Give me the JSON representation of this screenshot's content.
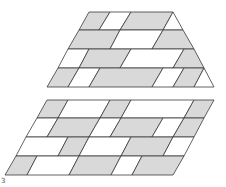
{
  "figure": {
    "colors": {
      "gray": "#d9d9d9",
      "white": "#ffffff",
      "stroke": "#3a3a3a"
    },
    "top_shape": {
      "type": "trapezoid",
      "rows": 4,
      "cells": [
        {
          "pts": "89,12 110,12 99,30 79,30",
          "fill": "gray"
        },
        {
          "pts": "110,12 131,12 120,30 99,30",
          "fill": "white"
        },
        {
          "pts": "131,12 173,12 163,30 120,30",
          "fill": "gray"
        },
        {
          "pts": "173,12 183,30 163,30",
          "fill": "white"
        },
        {
          "pts": "79,30 120,30 110,49 68,49",
          "fill": "gray"
        },
        {
          "pts": "120,30 163,30 152,49 110,49",
          "fill": "white"
        },
        {
          "pts": "163,30 183,30 194,49 152,49",
          "fill": "gray"
        },
        {
          "pts": "68,49 89,49 79,68 58,68",
          "fill": "white"
        },
        {
          "pts": "89,49 131,49 120,68 79,68",
          "fill": "gray"
        },
        {
          "pts": "131,49 184,49 173,68 120,68",
          "fill": "white"
        },
        {
          "pts": "184,49 194,49 204,68 173,68",
          "fill": "gray"
        },
        {
          "pts": "58,68 79,68 68,87 47,87",
          "fill": "gray"
        },
        {
          "pts": "79,68 100,68 89,87 68,87",
          "fill": "white"
        },
        {
          "pts": "100,68 163,68 152,87 89,87",
          "fill": "gray"
        },
        {
          "pts": "163,68 184,68 173,87 152,87",
          "fill": "white"
        },
        {
          "pts": "184,68 204,68 194,87 173,87",
          "fill": "gray"
        },
        {
          "pts": "204,68 214,87 194,87",
          "fill": "white"
        }
      ]
    },
    "bottom_shape": {
      "type": "parallelogram",
      "rows": 4,
      "cells": [
        {
          "pts": "47,100 68,100 58,118 37,118",
          "fill": "gray"
        },
        {
          "pts": "68,100 110,100 100,118 58,118",
          "fill": "white"
        },
        {
          "pts": "110,100 131,100 121,118 100,118",
          "fill": "gray"
        },
        {
          "pts": "131,100 194,100 184,118 121,118",
          "fill": "white"
        },
        {
          "pts": "194,100 214,100 204,118 184,118",
          "fill": "gray"
        },
        {
          "pts": "37,118 58,118 47,137 26,137",
          "fill": "white"
        },
        {
          "pts": "58,118 100,118 89,137 47,137",
          "fill": "gray"
        },
        {
          "pts": "100,118 121,118 110,137 89,137",
          "fill": "white"
        },
        {
          "pts": "121,118 163,118 152,137 110,137",
          "fill": "gray"
        },
        {
          "pts": "163,118 184,118 173,137 152,137",
          "fill": "white"
        },
        {
          "pts": "184,118 204,118 194,137 173,137",
          "fill": "gray"
        },
        {
          "pts": "26,137 68,137 58,156 16,156",
          "fill": "white"
        },
        {
          "pts": "68,137 89,137 79,156 58,156",
          "fill": "gray"
        },
        {
          "pts": "89,137 131,137 121,156 79,156",
          "fill": "white"
        },
        {
          "pts": "131,137 173,137 163,156 121,156",
          "fill": "gray"
        },
        {
          "pts": "173,137 194,137 184,156 163,156",
          "fill": "white"
        },
        {
          "pts": "16,156 37,156 27,175 5,175",
          "fill": "gray"
        },
        {
          "pts": "37,156 79,156 69,175 27,175",
          "fill": "white"
        },
        {
          "pts": "79,156 121,156 111,175 69,175",
          "fill": "gray"
        },
        {
          "pts": "121,156 142,156 132,175 111,175",
          "fill": "white"
        },
        {
          "pts": "142,156 184,156 173,175 132,175",
          "fill": "gray"
        }
      ]
    },
    "label": "3"
  }
}
